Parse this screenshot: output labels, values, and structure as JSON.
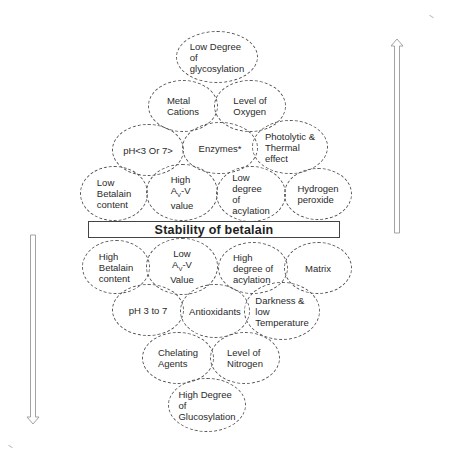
{
  "diagram": {
    "title": "Stability of betalain",
    "upper_section": {
      "direction": "decreasing stability",
      "arrow": "up",
      "factors": [
        {
          "id": "low-degree-glycosylation",
          "label": "Low Degree\nof\nglycosylation"
        },
        {
          "id": "metal-cations",
          "label": "Metal\nCations"
        },
        {
          "id": "level-of-oxygen",
          "label": "Level of\nOxygen"
        },
        {
          "id": "ph-lt3-or-gt7",
          "label": "pH<3 Or 7>"
        },
        {
          "id": "enzymes",
          "label": "Enzymes*"
        },
        {
          "id": "photolytic-thermal",
          "label": "Photolytic &\nThermal\neffect"
        },
        {
          "id": "low-betalain-content",
          "label": "Low\nBetalain\ncontent"
        },
        {
          "id": "high-av-v",
          "label_pre": "High\nA",
          "label_sub": "V",
          "label_post": "-V\nvalue"
        },
        {
          "id": "low-degree-acylation",
          "label": "Low\ndegree\nof\nacylation"
        },
        {
          "id": "hydrogen-peroxide",
          "label": "Hydrogen\nperoxide"
        }
      ]
    },
    "lower_section": {
      "direction": "increasing stability",
      "arrow": "down",
      "factors": [
        {
          "id": "high-betalain-content",
          "label": "High\nBetalain\ncontent"
        },
        {
          "id": "low-av-v",
          "label_pre": "Low\nA",
          "label_sub": "V",
          "label_post": "-V\nValue"
        },
        {
          "id": "high-degree-acylation",
          "label": "High\ndegree of\nacylation"
        },
        {
          "id": "matrix",
          "label": "Matrix"
        },
        {
          "id": "ph-3-to-7",
          "label": "pH 3 to 7"
        },
        {
          "id": "antioxidants",
          "label": "Antioxidants"
        },
        {
          "id": "darkness-low-temp",
          "label": "Darkness &\nlow\nTemperature"
        },
        {
          "id": "chelating-agents",
          "label": "Chelating\nAgents"
        },
        {
          "id": "level-of-nitrogen",
          "label": "Level of\nNitrogen"
        },
        {
          "id": "high-degree-glucosylation",
          "label": "High Degree\nof\nGlucosylation"
        }
      ]
    },
    "colors": {
      "stroke": "#555555",
      "text": "#2a2a2a",
      "background": "#ffffff"
    }
  }
}
